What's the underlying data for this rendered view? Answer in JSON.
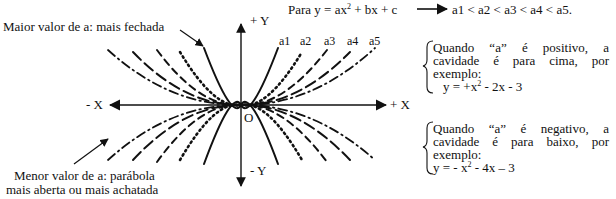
{
  "header": {
    "formula_prefix": "Para y = ax",
    "formula_exp": "2",
    "formula_suffix": " + bx + c",
    "order": "a1 < a2 < a3 < a4 < a5."
  },
  "annotations": {
    "max_a": "Maior valor de a: mais fechada",
    "min_a_line1": "Menor valor de a: parábola",
    "min_a_line2": "mais aberta ou mais achatada"
  },
  "axes": {
    "pos_y": "+ Y",
    "neg_y": "- Y",
    "pos_x": "+ X",
    "neg_x": "- X",
    "origin": "O"
  },
  "curve_labels": [
    "a1",
    "a2",
    "a3",
    "a4",
    "a5"
  ],
  "positive_note": {
    "line1": "Quando “a” é positivo, a",
    "line2": "cavidade é para cima, por",
    "line3": "exemplo:",
    "example_prefix": "y = +x",
    "example_exp": "2",
    "example_suffix": " - 2x - 3"
  },
  "negative_note": {
    "line1": "Quando “a” é negativo, a",
    "line2": "cavidade é para baixo, por",
    "line3": "exemplo:",
    "example_prefix": "y = - x",
    "example_exp": "2",
    "example_suffix": " - 4x – 3"
  },
  "colors": {
    "ink": "#111111",
    "background": "#ffffff"
  }
}
